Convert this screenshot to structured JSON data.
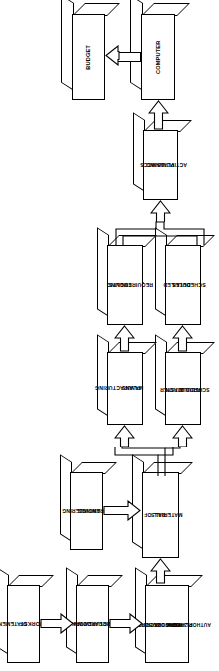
{
  "diagram": {
    "orientation": "rotated-90",
    "stroke_color": "#000000",
    "fill_color": "#ffffff",
    "nodes": [
      {
        "id": "budget",
        "label": "BUDGET",
        "lines": [
          "BUDGET"
        ]
      },
      {
        "id": "computer",
        "label": "COMPUTER",
        "lines": [
          "COMPUTER"
        ]
      },
      {
        "id": "mccs",
        "label": "MCCS PLANNING ACTIVITIES",
        "lines": [
          "MCCS",
          "PLANNING",
          "ACTIVITIES"
        ]
      },
      {
        "id": "tooling",
        "label": "TOOLING REQUIREMENTS",
        "lines": [
          "TOOLING",
          "REQUIREMENTS"
        ]
      },
      {
        "id": "schedules",
        "label": "DETAILED SCHEDULES",
        "lines": [
          "DETAILED",
          "SCHEDULES"
        ]
      },
      {
        "id": "mfgplans",
        "label": "MANUFACTURING PLANS",
        "lines": [
          "MANUFACTURING",
          "PLANS"
        ]
      },
      {
        "id": "master",
        "label": "MASTER PRODUCTION SCHEDULE",
        "lines": [
          "MASTER",
          "PRODUCTION",
          "SCHEDULE"
        ]
      },
      {
        "id": "engdwg",
        "label": "ENGINEERING DRAWINGS",
        "lines": [
          "ENGINEERING",
          "DRAWINGS"
        ]
      },
      {
        "id": "bom",
        "label": "BILL OF MATERIALS",
        "lines": [
          "BILL OF",
          "MATERIALS"
        ]
      },
      {
        "id": "sow",
        "label": "STATEMENT OF WORK",
        "lines": [
          "STATEMENT",
          "OF",
          "WORK"
        ]
      },
      {
        "id": "wbs",
        "label": "WORK BREAKDOWN STRUCTURE",
        "lines": [
          "WORK",
          "BREAKDOWN",
          "STRUCTURE"
        ]
      },
      {
        "id": "swd",
        "label": "SUBDIVIDED WORK DESCRIPTION OR WORK PLANNING AUTHORIZATION",
        "lines": [
          "SUBDIVIDED",
          "WORK DESCRIPTION",
          "OR WORK",
          "PLANNING",
          "AUTHORIZATION"
        ]
      }
    ],
    "edges": [
      {
        "from": "computer",
        "to": "budget",
        "type": "block-arrow"
      },
      {
        "from": "mccs",
        "to": "computer",
        "type": "block-arrow"
      },
      {
        "from": "tooling",
        "to": "mccs",
        "type": "manifold-arrow"
      },
      {
        "from": "schedules",
        "to": "mccs",
        "type": "manifold-arrow"
      },
      {
        "from": "mfgplans",
        "to": "tooling",
        "type": "block-arrow"
      },
      {
        "from": "master",
        "to": "schedules",
        "type": "block-arrow"
      },
      {
        "from": "bom",
        "to": "mfgplans",
        "type": "manifold-arrow"
      },
      {
        "from": "bom",
        "to": "master",
        "type": "manifold-arrow"
      },
      {
        "from": "engdwg",
        "to": "bom",
        "type": "block-arrow"
      },
      {
        "from": "swd",
        "to": "bom",
        "type": "block-arrow"
      },
      {
        "from": "sow",
        "to": "wbs",
        "type": "block-arrow"
      },
      {
        "from": "wbs",
        "to": "swd",
        "type": "block-arrow"
      }
    ]
  }
}
